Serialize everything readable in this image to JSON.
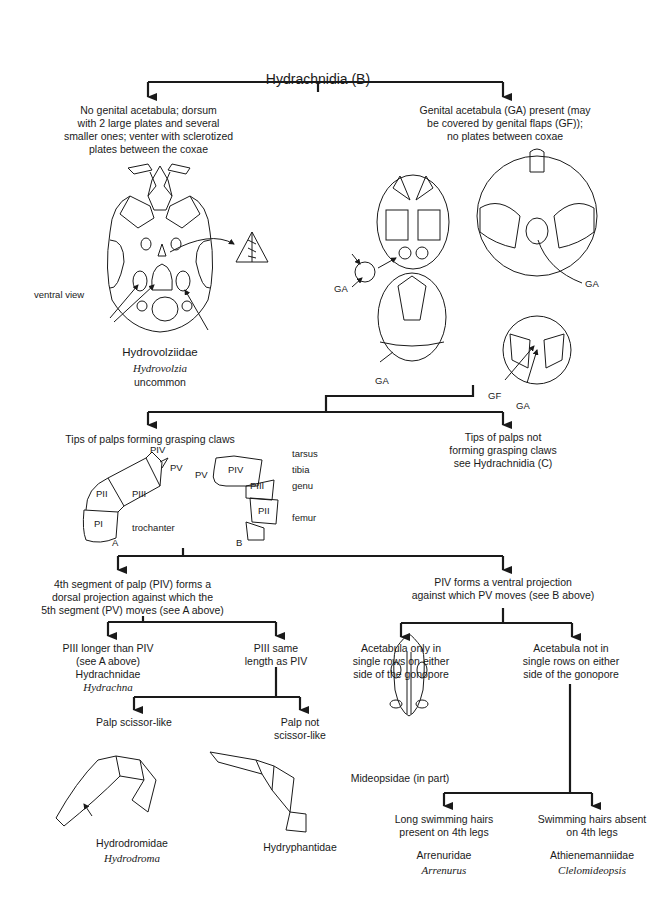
{
  "title": "Hydrachnidia (B)",
  "colors": {
    "ink": "#1a1a1a",
    "background": "#ffffff"
  },
  "nodes": {
    "left1": {
      "text": "No genital acetabula; dorsum\nwith 2 large plates and several\nsmaller ones; venter with sclerotized\nplates between the coxae",
      "view_label": "ventral view",
      "family": "Hydrovolziidae",
      "genus": "Hydrovolzia",
      "note": "uncommon"
    },
    "right1": {
      "text": "Genital acetabula (GA) present (may\nbe covered by genital flaps (GF));\nno plates between coxae",
      "labels": [
        "GA",
        "GA",
        "GA",
        "GF",
        "GA"
      ]
    },
    "left2": {
      "text": "Tips of palps forming grasping claws",
      "palpA": {
        "letter": "A",
        "labels": [
          "PIV",
          "PV",
          "PII",
          "PIII",
          "PI",
          "trochanter"
        ]
      },
      "palpB": {
        "letter": "B",
        "labels": [
          "PV",
          "PIV",
          "PIII",
          "PII",
          "tarsus",
          "tibia",
          "genu",
          "femur"
        ]
      }
    },
    "right2": {
      "text": "Tips of palps not\nforming grasping claws\nsee Hydrachnidia (C)"
    },
    "left3": {
      "text": "4th segment of palp (PIV) forms a\ndorsal projection against which the\n5th segment (PV) moves (see A above)"
    },
    "right3": {
      "text": "PIV forms a ventral projection\nagainst which PV moves (see B above)"
    },
    "l3a": {
      "text": "PIII longer than PIV\n(see A above)\nHydrachnidae",
      "genus": "Hydrachna"
    },
    "l3b": {
      "text": "PIII same\nlength as PIV"
    },
    "l4a": {
      "text": "Palp scissor-like",
      "family": "Hydrodromidae",
      "genus": "Hydrodroma"
    },
    "l4b": {
      "text": "Palp not\nscissor-like",
      "family": "Hydryphantidae"
    },
    "r3a": {
      "text": "Acetabula only in\nsingle rows on either\nside of the gonopore",
      "family": "Mideopsidae (in part)"
    },
    "r3b": {
      "text": "Acetabula not in\nsingle rows on either\nside of the gonopore"
    },
    "r4a": {
      "text": "Long swimming hairs\npresent on 4th legs",
      "family": "Arrenuridae",
      "genus": "Arrenurus"
    },
    "r4b": {
      "text": "Swimming hairs absent\non 4th legs",
      "family": "Athienemanniidae",
      "genus": "Clelomideopsis"
    }
  }
}
